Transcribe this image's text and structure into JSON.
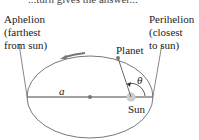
{
  "diagram": {
    "top_partial_text": "...turn gives the answer...",
    "aphelion": {
      "line1": "Aphelion",
      "line2": "(farthest",
      "line3": "from sun)"
    },
    "perihelion": {
      "line1": "Perihelion",
      "line2": "(closest",
      "line3": "to sun)"
    },
    "planet_label": "Planet",
    "sun_label": "Sun",
    "semi_major_label": "a",
    "angle_label": "θ",
    "colors": {
      "orbit": "#555555",
      "body": "#8a8a8a",
      "sun": "#c8c8c8",
      "arrow": "#777777"
    }
  }
}
